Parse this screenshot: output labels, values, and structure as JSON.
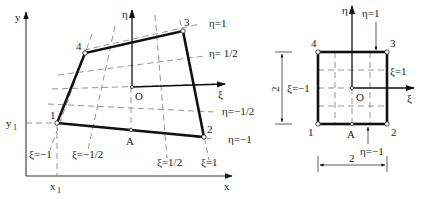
{
  "physical_element": {
    "axes": {
      "x_label": "x",
      "y_label": "y",
      "x1_label": "x",
      "x1_sub": "1",
      "y1_label": "y",
      "y1_sub": "1"
    },
    "local_axes": {
      "xi_label": "ξ",
      "eta_label": "η",
      "origin_label": "O"
    },
    "nodes": [
      {
        "id": "1",
        "label": "1"
      },
      {
        "id": "2",
        "label": "2"
      },
      {
        "id": "3",
        "label": "3"
      },
      {
        "id": "4",
        "label": "4"
      }
    ],
    "point_a_label": "A",
    "eta_lines": [
      {
        "value": "η=1"
      },
      {
        "value": "η= 1/2"
      },
      {
        "value": "η=−1/2"
      },
      {
        "value": "η=−1"
      }
    ],
    "xi_lines": [
      {
        "value": "ξ=−1"
      },
      {
        "value": "ξ=−1/2"
      },
      {
        "value": "ξ=1/2"
      },
      {
        "value": "ξ=1"
      }
    ]
  },
  "reference_element": {
    "local_axes": {
      "xi_label": "ξ",
      "eta_label": "η",
      "origin_label": "O"
    },
    "nodes": [
      {
        "id": "1",
        "label": "1"
      },
      {
        "id": "2",
        "label": "2"
      },
      {
        "id": "3",
        "label": "3"
      },
      {
        "id": "4",
        "label": "4"
      }
    ],
    "point_a_label": "A",
    "edge_labels": {
      "top": "η=1",
      "bottom": "η=−1",
      "left": "ξ=−1",
      "right": "ξ=1"
    },
    "dimensions": {
      "height": "2",
      "width": "2"
    }
  }
}
